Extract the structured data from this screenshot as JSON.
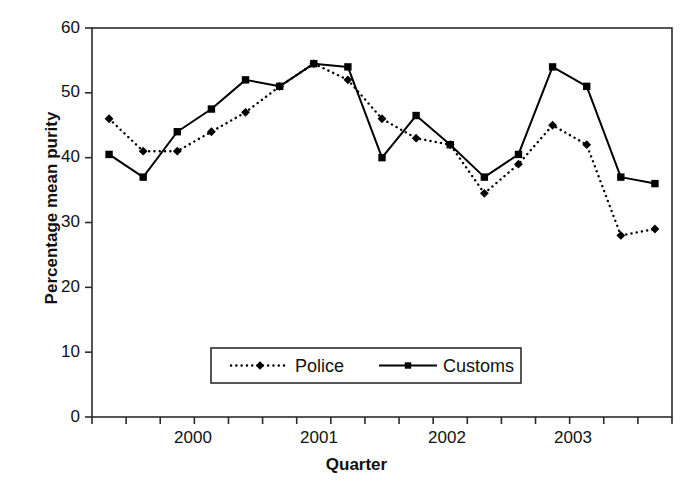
{
  "chart_data": {
    "type": "line",
    "title": "",
    "xlabel": "Quarter",
    "ylabel": "Percentage mean purity",
    "ylim": [
      0,
      60
    ],
    "ytick_labels": [
      "0",
      "10",
      "20",
      "30",
      "40",
      "50",
      "60"
    ],
    "ytick_values": [
      0,
      10,
      20,
      30,
      40,
      50,
      60
    ],
    "xtick_year_labels": [
      "2000",
      "2001",
      "2002",
      "2003"
    ],
    "x_indices": [
      0,
      1,
      2,
      3,
      4,
      5,
      6,
      7,
      8,
      9,
      10,
      11,
      12,
      13,
      14,
      15,
      16
    ],
    "n_points": 17,
    "grid": false,
    "legend_position": "inside-bottom-center",
    "series": [
      {
        "name": "Police",
        "style": "dotted",
        "marker": "diamond",
        "color": "#000000",
        "values": [
          46,
          41,
          41,
          44,
          47,
          51,
          54.5,
          52,
          46,
          43,
          42,
          34.5,
          39,
          45,
          42,
          28,
          29
        ]
      },
      {
        "name": "Customs",
        "style": "solid",
        "marker": "square",
        "color": "#000000",
        "values": [
          40.5,
          37,
          44,
          47.5,
          52,
          51,
          54.5,
          54,
          40,
          46.5,
          42,
          37,
          40.5,
          54,
          51,
          37,
          36
        ]
      }
    ]
  },
  "axis": {
    "y_label": "Percentage mean purity",
    "x_label": "Quarter"
  },
  "legend": {
    "entries": [
      {
        "label": "Police"
      },
      {
        "label": "Customs"
      }
    ]
  }
}
